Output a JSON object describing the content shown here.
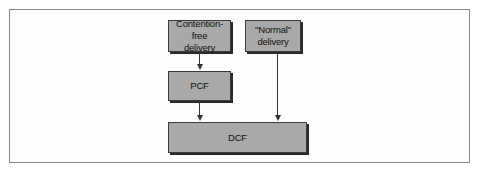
{
  "diagram": {
    "type": "flow",
    "nodes": [
      {
        "id": "contention-free",
        "label_line1": "Contention-free",
        "label_line2": "delivery"
      },
      {
        "id": "normal",
        "label_line1": "\"Normal\"",
        "label_line2": "delivery"
      },
      {
        "id": "pcf",
        "label": "PCF"
      },
      {
        "id": "dcf",
        "label": "DCF"
      }
    ],
    "edges": [
      {
        "from": "contention-free",
        "to": "pcf"
      },
      {
        "from": "pcf",
        "to": "dcf"
      },
      {
        "from": "normal",
        "to": "dcf"
      }
    ],
    "colors": {
      "box_fill": "#a9a9a9",
      "box_border": "#3a3a3a",
      "arrow": "#333333",
      "frame": "#8a8a8a"
    }
  }
}
